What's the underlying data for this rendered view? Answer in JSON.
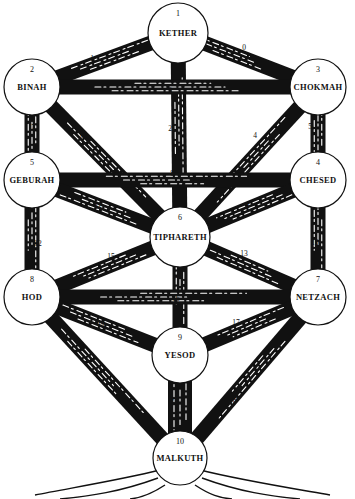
{
  "diagram": {
    "style": "woodcut tree with sephiroth circles",
    "colors": {
      "ink": "#111111",
      "paper": "#ffffff"
    }
  },
  "sephiroth": [
    {
      "number": "1",
      "name": "KETHER",
      "x": 178,
      "y": 33,
      "r": 30
    },
    {
      "number": "2",
      "name": "BINAH",
      "x": 32,
      "y": 87,
      "r": 28
    },
    {
      "number": "3",
      "name": "CHOKMAH",
      "x": 318,
      "y": 87,
      "r": 28
    },
    {
      "number": "5",
      "name": "GEBURAH",
      "x": 32,
      "y": 180,
      "r": 28
    },
    {
      "number": "4",
      "name": "CHESED",
      "x": 318,
      "y": 180,
      "r": 28
    },
    {
      "number": "6",
      "name": "TIPHARETH",
      "x": 180,
      "y": 237,
      "r": 30
    },
    {
      "number": "8",
      "name": "HOD",
      "x": 32,
      "y": 297,
      "r": 28
    },
    {
      "number": "7",
      "name": "NETZACH",
      "x": 318,
      "y": 297,
      "r": 28
    },
    {
      "number": "9",
      "name": "YESOD",
      "x": 180,
      "y": 355,
      "r": 28
    },
    {
      "number": "10",
      "name": "MALKUTH",
      "x": 180,
      "y": 458,
      "r": 27
    }
  ],
  "paths": [
    {
      "label": "0",
      "from": "KETHER",
      "to": "CHOKMAH",
      "lx": 244,
      "ly": 47
    },
    {
      "label": "1",
      "from": "KETHER",
      "to": "BINAH",
      "lx": 92,
      "ly": 58
    },
    {
      "label": "2",
      "from": "KETHER",
      "to": "TIPHARETH",
      "lx": 170,
      "ly": 128
    },
    {
      "label": "3",
      "from": "BINAH",
      "to": "CHOKMAH",
      "lx": 170,
      "ly": 90
    },
    {
      "label": "4",
      "from": "CHOKMAH",
      "to": "TIPHARETH",
      "lx": 255,
      "ly": 135
    },
    {
      "label": "5",
      "from": "CHOKMAH",
      "to": "CHESED",
      "lx": 310,
      "ly": 126
    },
    {
      "label": "6",
      "from": "BINAH",
      "to": "TIPHARETH",
      "lx": 82,
      "ly": 135
    },
    {
      "label": "7",
      "from": "BINAH",
      "to": "GEBURAH",
      "lx": 33,
      "ly": 127
    },
    {
      "label": "8",
      "from": "GEBURAH",
      "to": "CHESED",
      "lx": 172,
      "ly": 173
    },
    {
      "label": "9",
      "from": "CHESED",
      "to": "TIPHARETH",
      "lx": 247,
      "ly": 206
    },
    {
      "label": "10",
      "from": "CHESED",
      "to": "NETZACH",
      "lx": 315,
      "ly": 242
    },
    {
      "label": "11",
      "from": "GEBURAH",
      "to": "TIPHARETH",
      "lx": 98,
      "ly": 206
    },
    {
      "label": "12",
      "from": "GEBURAH",
      "to": "HOD",
      "lx": 38,
      "ly": 243
    },
    {
      "label": "13",
      "from": "TIPHARETH",
      "to": "NETZACH",
      "lx": 244,
      "ly": 253
    },
    {
      "label": "14",
      "from": "TIPHARETH",
      "to": "YESOD",
      "lx": 176,
      "ly": 276
    },
    {
      "label": "15",
      "from": "TIPHARETH",
      "to": "HOD",
      "lx": 111,
      "ly": 256
    },
    {
      "label": "16",
      "from": "HOD",
      "to": "NETZACH",
      "lx": 176,
      "ly": 298
    },
    {
      "label": "17",
      "from": "NETZACH",
      "to": "YESOD",
      "lx": 236,
      "ly": 322
    },
    {
      "label": "18",
      "from": "NETZACH",
      "to": "MALKUTH",
      "lx": 233,
      "ly": 400
    },
    {
      "label": "19",
      "from": "HOD",
      "to": "YESOD",
      "lx": 101,
      "ly": 324
    },
    {
      "label": "20",
      "from": "HOD",
      "to": "MALKUTH",
      "lx": 128,
      "ly": 402
    },
    {
      "label": "21",
      "from": "YESOD",
      "to": "MALKUTH",
      "lx": 174,
      "ly": 400
    }
  ]
}
